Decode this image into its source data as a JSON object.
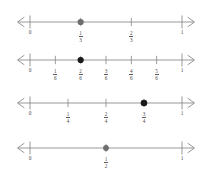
{
  "figure": {
    "line_color": "#8c8c8c",
    "tick_color": "#8c8c8c",
    "label_color": "#4a4a4a",
    "dot_color_light": "#6e6e6e",
    "dot_color_dark": "#1a1a1a",
    "background": "#ffffff",
    "axis_left_x": 30,
    "axis_right_x": 182
  },
  "lines": [
    {
      "id": "number-line-thirds",
      "denominator": 3,
      "axis_y": 22,
      "top": 0,
      "start_label": "0",
      "end_label": "1",
      "dot_value": "1/3",
      "dot_fraction": 0.3333,
      "dot_color": "#6e6e6e",
      "dot_radius": 3.1,
      "ticks": [
        {
          "fraction": 0.3333,
          "numerator": "1",
          "denominator": "3",
          "marked": true
        },
        {
          "fraction": 0.6667,
          "numerator": "2",
          "denominator": "3",
          "marked": false
        }
      ]
    },
    {
      "id": "number-line-sixths",
      "denominator": 6,
      "axis_y": 60,
      "top": 38,
      "start_label": "0",
      "end_label": "1",
      "dot_value": "2/6",
      "dot_fraction": 0.3333,
      "dot_color": "#1a1a1a",
      "dot_radius": 3.1,
      "ticks": [
        {
          "fraction": 0.1667,
          "numerator": "1",
          "denominator": "6",
          "marked": false
        },
        {
          "fraction": 0.3333,
          "numerator": "2",
          "denominator": "6",
          "marked": true
        },
        {
          "fraction": 0.5,
          "numerator": "3",
          "denominator": "6",
          "marked": false
        },
        {
          "fraction": 0.6667,
          "numerator": "4",
          "denominator": "6",
          "marked": false
        },
        {
          "fraction": 0.8333,
          "numerator": "5",
          "denominator": "6",
          "marked": false
        }
      ]
    },
    {
      "id": "number-line-fourths",
      "denominator": 4,
      "axis_y": 103,
      "top": 81,
      "start_label": "0",
      "end_label": "1",
      "dot_value": "3/4",
      "dot_fraction": 0.75,
      "dot_color": "#1a1a1a",
      "dot_radius": 3.3,
      "ticks": [
        {
          "fraction": 0.25,
          "numerator": "1",
          "denominator": "4",
          "marked": false
        },
        {
          "fraction": 0.5,
          "numerator": "2",
          "denominator": "4",
          "marked": false
        },
        {
          "fraction": 0.75,
          "numerator": "3",
          "denominator": "4",
          "marked": true
        }
      ]
    },
    {
      "id": "number-line-halves",
      "denominator": 2,
      "axis_y": 148,
      "top": 126,
      "start_label": "0",
      "end_label": "1",
      "dot_value": "1/2",
      "dot_fraction": 0.5,
      "dot_color": "#6e6e6e",
      "dot_radius": 2.9,
      "ticks": [
        {
          "fraction": 0.5,
          "numerator": "1",
          "denominator": "2",
          "marked": true
        }
      ]
    }
  ]
}
